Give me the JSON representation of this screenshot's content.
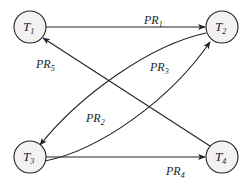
{
  "diagram": {
    "type": "directed-graph",
    "nodes": [
      {
        "id": "T1",
        "letter": "T",
        "sub": "1",
        "cx": 30,
        "cy": 27
      },
      {
        "id": "T2",
        "letter": "T",
        "sub": "2",
        "cx": 222,
        "cy": 27
      },
      {
        "id": "T3",
        "letter": "T",
        "sub": "3",
        "cx": 30,
        "cy": 157
      },
      {
        "id": "T4",
        "letter": "T",
        "sub": "4",
        "cx": 222,
        "cy": 157
      }
    ],
    "edges": [
      {
        "id": "PR1",
        "from": "T1",
        "to": "T2",
        "letter": "PR",
        "sub": "1"
      },
      {
        "id": "PR2",
        "from": "T3",
        "to": "T2",
        "letter": "PR",
        "sub": "2"
      },
      {
        "id": "PR3",
        "from": "T2",
        "to": "T3",
        "letter": "PR",
        "sub": "3"
      },
      {
        "id": "PR4",
        "from": "T3",
        "to": "T4",
        "letter": "PR",
        "sub": "4"
      },
      {
        "id": "PR5",
        "from": "T4",
        "to": "T1",
        "letter": "PR",
        "sub": "5"
      }
    ]
  },
  "colors": {
    "stroke": "#222222",
    "node_fill": "#f2f2f2",
    "background": "#ffffff"
  }
}
